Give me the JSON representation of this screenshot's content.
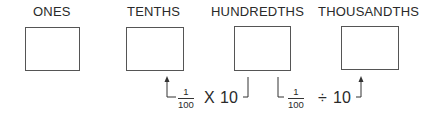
{
  "columns": [
    {
      "label": "ONES"
    },
    {
      "label": "TENTHS"
    },
    {
      "label": "HUNDREDTHS"
    },
    {
      "label": "THOUSANDTHS"
    }
  ],
  "annotations": [
    {
      "numerator": "1",
      "denominator": "100",
      "operator": "X",
      "operand": "10"
    },
    {
      "numerator": "1",
      "denominator": "100",
      "operator": "÷",
      "operand": "10"
    }
  ],
  "colors": {
    "line": "#333333",
    "box_border": "#555555",
    "text": "#2a2a2a"
  }
}
